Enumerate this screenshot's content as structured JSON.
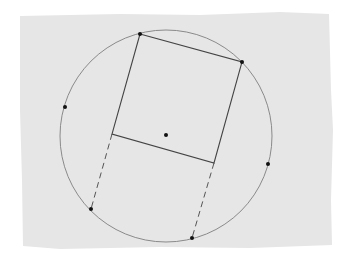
{
  "diagram": {
    "paper": {
      "fill": "#e6e6e6",
      "outline": [
        [
          20,
          16
        ],
        [
          120,
          14
        ],
        [
          200,
          15
        ],
        [
          280,
          12
        ],
        [
          329,
          14
        ],
        [
          331,
          90
        ],
        [
          333,
          130
        ],
        [
          331,
          200
        ],
        [
          332,
          245
        ],
        [
          250,
          248
        ],
        [
          160,
          247
        ],
        [
          60,
          249
        ],
        [
          23,
          246
        ],
        [
          22,
          180
        ],
        [
          20,
          110
        ],
        [
          20,
          60
        ]
      ]
    },
    "circle": {
      "cx": 166,
      "cy": 136,
      "rx": 106,
      "ry": 106,
      "stroke": "#8a8a8a"
    },
    "square": {
      "vertices": [
        [
          140,
          34
        ],
        [
          242,
          62
        ],
        [
          214,
          163
        ],
        [
          112,
          134
        ]
      ],
      "stroke": "#444444"
    },
    "dashed_lines": [
      {
        "from": [
          112,
          134
        ],
        "to": [
          91,
          209
        ]
      },
      {
        "from": [
          214,
          163
        ],
        "to": [
          192,
          238
        ]
      }
    ],
    "points": [
      {
        "name": "square-top-left",
        "x": 140,
        "y": 34
      },
      {
        "name": "square-top-right",
        "x": 242,
        "y": 62
      },
      {
        "name": "circle-left",
        "x": 65,
        "y": 107
      },
      {
        "name": "center",
        "x": 166,
        "y": 135
      },
      {
        "name": "circle-right",
        "x": 268,
        "y": 164
      },
      {
        "name": "circle-bottom-left",
        "x": 91,
        "y": 209
      },
      {
        "name": "circle-bottom",
        "x": 192,
        "y": 238
      }
    ],
    "point_color": "#111111"
  }
}
